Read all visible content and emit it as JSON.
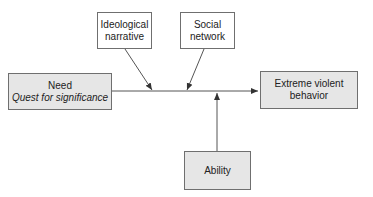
{
  "diagram": {
    "type": "flow",
    "nodes": {
      "need": {
        "title": "Need",
        "subtitle": "Quest for significance",
        "fill": "#e6e6e6"
      },
      "ideological": {
        "line1": "Ideological",
        "line2": "narrative",
        "fill": "#ffffff"
      },
      "social": {
        "line1": "Social",
        "line2": "network",
        "fill": "#ffffff"
      },
      "outcome": {
        "line1": "Extreme violent",
        "line2": "behavior",
        "fill": "#e6e6e6"
      },
      "ability": {
        "label": "Ability",
        "fill": "#e6e6e6"
      }
    },
    "edges": [
      {
        "from": "need",
        "to": "outcome"
      },
      {
        "from": "ideological",
        "to": "need-outcome-line"
      },
      {
        "from": "social",
        "to": "need-outcome-line"
      },
      {
        "from": "ability",
        "to": "need-outcome-line"
      }
    ],
    "colors": {
      "stroke": "#555555",
      "shaded_fill": "#e6e6e6"
    }
  }
}
